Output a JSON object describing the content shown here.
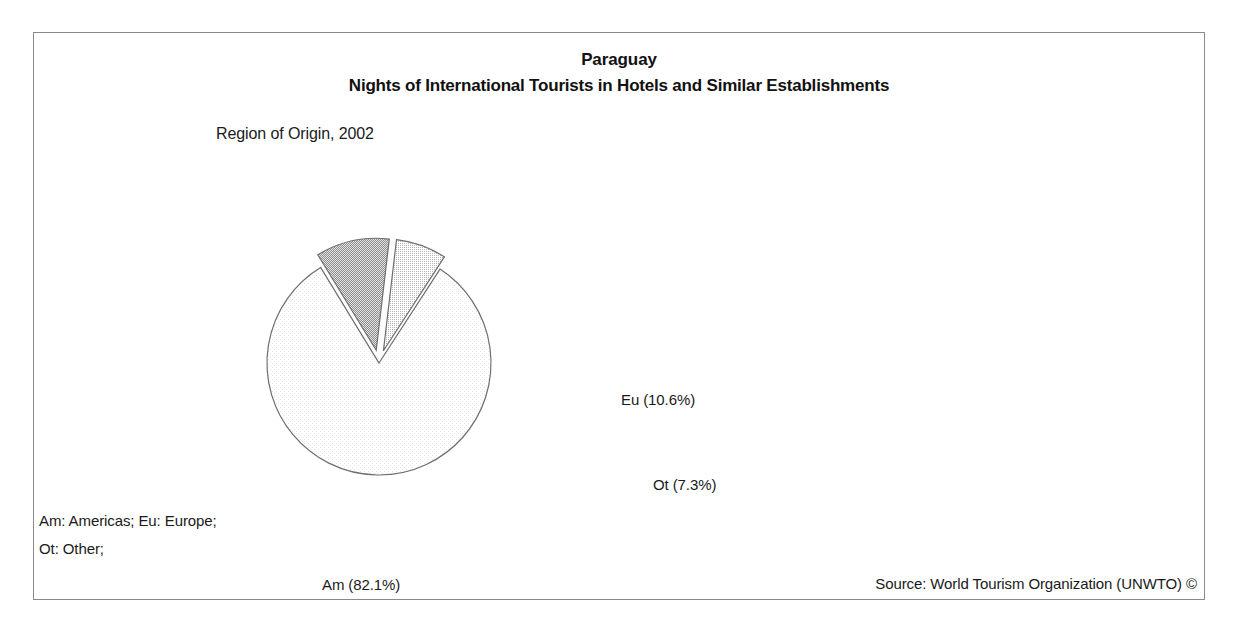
{
  "figure": {
    "title": "Paraguay",
    "subtitle": "Nights of International Tourists in Hotels and Similar Establishments",
    "caption": "Region of Origin, 2002",
    "legend_lines": [
      "Am: Americas; Eu: Europe;",
      "Ot: Other;"
    ],
    "source": "Source: World Tourism Organization (UNWTO) ©"
  },
  "labels": {
    "am": "Am (82.1%)",
    "eu": "Eu (10.6%)",
    "ot": "Ot (7.3%)"
  },
  "chart_data": {
    "type": "pie",
    "subtitle": "Region of Origin, 2002",
    "categories": [
      "Am",
      "Eu",
      "Ot"
    ],
    "category_names": [
      "Americas",
      "Europe",
      "Other"
    ],
    "values": [
      82.1,
      10.6,
      7.3
    ],
    "value_unit": "percent",
    "data_labels": [
      "Am (82.1%)",
      "Eu (10.6%)",
      "Ot (7.3%)"
    ],
    "exploded": [
      false,
      true,
      true
    ],
    "start_angle_deg": -57,
    "direction": "clockwise",
    "slice_fills": [
      "#fbfbfb",
      "#b9b9b9",
      "#dcdcdc"
    ],
    "slice_stroke": "#6e6e6e",
    "legend_position": "bottom-left",
    "grid": false,
    "xlabel": "",
    "ylabel": ""
  }
}
